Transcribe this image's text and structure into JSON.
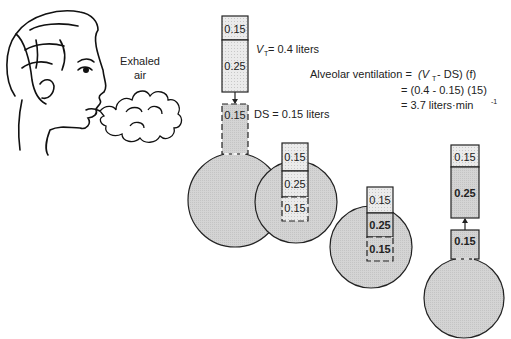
{
  "labels": {
    "exhaled_line1": "Exhaled",
    "exhaled_line2": "air",
    "vt_symbol": "V",
    "vt_sub": "T",
    "vt_rest": " = 0.4 liters",
    "ds_label": "DS = 0.15 liters"
  },
  "equation": {
    "lhs": "Alveolar ventilation  =",
    "line1_a": "(V",
    "line1_sub": "T",
    "line1_b": " - DS) (f)",
    "line2": "=  (0.4 - 0.15) (15)",
    "line3_a": "=  3.7 liters·min",
    "line3_sup": "-1"
  },
  "stages": [
    {
      "top": "0.15",
      "middle": "0.25",
      "bottom": "0.15"
    },
    {
      "top": "0.15",
      "middle": "0.25",
      "bottom": "0.15"
    },
    {
      "top": "0.15",
      "middle": "0.25",
      "bottom": "0.15"
    },
    {
      "top": "0.15",
      "middle": "0.25",
      "bottom": "0.15"
    }
  ],
  "colors": {
    "fill": "#d6d6d6",
    "light": "#e8e8e8",
    "stroke": "#222222"
  }
}
